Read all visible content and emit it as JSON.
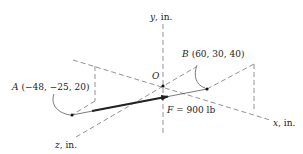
{
  "diagram": {
    "axes": {
      "x": {
        "label_var": "x",
        "label_unit": ", in."
      },
      "y": {
        "label_var": "y",
        "label_unit": ", in."
      },
      "z": {
        "label_var": "z",
        "label_unit": ", in."
      }
    },
    "origin": {
      "label": "O"
    },
    "point_a": {
      "name": "A",
      "coords": "(−48, −25, 20)"
    },
    "point_b": {
      "name": "B",
      "coords": "(60, 30, 40)"
    },
    "force": {
      "symbol": "F",
      "value": " = 900 lb"
    },
    "colors": {
      "dashed_lines": "#777777",
      "force_arrow": "#222222",
      "text": "#222222"
    }
  }
}
